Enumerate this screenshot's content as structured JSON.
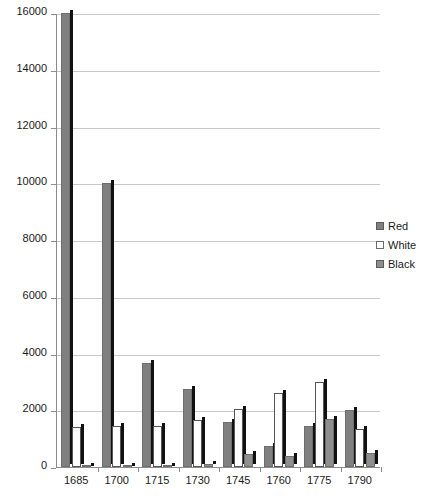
{
  "chart_data": {
    "type": "bar",
    "title": "",
    "subtitle": "",
    "xlabel": "",
    "ylabel": "",
    "categories": [
      "1685",
      "1700",
      "1715",
      "1730",
      "1745",
      "1760",
      "1775",
      "1790"
    ],
    "series": [
      {
        "name": "Red",
        "color": "#808080",
        "values": [
          16000,
          10000,
          3650,
          2750,
          1600,
          750,
          1450,
          2000
        ]
      },
      {
        "name": "White",
        "color": "#ffffff",
        "values": [
          1400,
          1450,
          1450,
          1650,
          2050,
          2600,
          3000,
          1350
        ]
      },
      {
        "name": "Black",
        "color": "#8f8f8f",
        "values": [
          50,
          50,
          50,
          100,
          450,
          400,
          1700,
          500
        ]
      }
    ],
    "ylim": [
      0,
      16000
    ],
    "ytick_values": [
      0,
      2000,
      4000,
      6000,
      8000,
      10000,
      12000,
      14000,
      16000
    ],
    "ytick_labels": [
      "0",
      "2000",
      "4000",
      "6000",
      "8000",
      "10000",
      "12000",
      "14000",
      "16000"
    ],
    "grid": true,
    "grid_axis": "y",
    "legend_position": "right",
    "legend": [
      {
        "label": "Red",
        "swatch": "sw-red"
      },
      {
        "label": "White",
        "swatch": "sw-white"
      },
      {
        "label": "Black",
        "swatch": "sw-black"
      }
    ]
  }
}
